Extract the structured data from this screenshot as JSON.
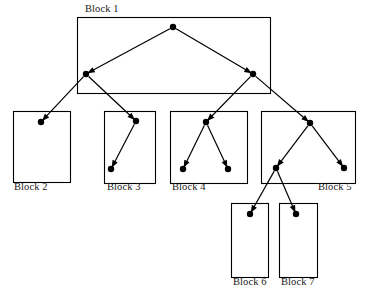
{
  "diagram": {
    "type": "tree-block-diagram",
    "background_color": "#ffffff",
    "stroke_color": "#000000",
    "node_color": "#000000",
    "canvas": {
      "width": 367,
      "height": 301
    },
    "blocks": [
      {
        "id": "block1",
        "label": "Block 1",
        "label_position": "above-left",
        "label_x": 85,
        "label_y": 3,
        "x": 77,
        "y": 17,
        "width": 193,
        "height": 76
      },
      {
        "id": "block2",
        "label": "Block 2",
        "label_position": "below-left",
        "label_x": 14,
        "label_y": 181,
        "x": 13,
        "y": 111,
        "width": 57,
        "height": 71
      },
      {
        "id": "block3",
        "label": "Block 3",
        "label_position": "below-left",
        "label_x": 107,
        "label_y": 181,
        "x": 104,
        "y": 111,
        "width": 51,
        "height": 72
      },
      {
        "id": "block4",
        "label": "Block 4",
        "label_position": "below-left",
        "label_x": 172,
        "label_y": 181,
        "x": 170,
        "y": 111,
        "width": 77,
        "height": 72
      },
      {
        "id": "block5",
        "label": "Block 5",
        "label_position": "below-right",
        "label_x": 318,
        "label_y": 181,
        "x": 261,
        "y": 111,
        "width": 94,
        "height": 72
      },
      {
        "id": "block6",
        "label": "Block 6",
        "label_position": "below-left",
        "label_x": 233,
        "label_y": 276,
        "x": 231,
        "y": 203,
        "width": 37,
        "height": 74
      },
      {
        "id": "block7",
        "label": "Block 7",
        "label_position": "below-left",
        "label_x": 281,
        "label_y": 276,
        "x": 279,
        "y": 203,
        "width": 38,
        "height": 74
      }
    ],
    "nodes": [
      {
        "id": "n-root",
        "x": 173,
        "y": 27,
        "block": "block1",
        "radius": 3.2
      },
      {
        "id": "n-l",
        "x": 86,
        "y": 74,
        "block": "block1",
        "radius": 3.2
      },
      {
        "id": "n-r",
        "x": 253,
        "y": 74,
        "block": "block1",
        "radius": 3.2
      },
      {
        "id": "n-b2",
        "x": 41,
        "y": 122,
        "block": "block2",
        "radius": 3.2
      },
      {
        "id": "n-b3a",
        "x": 136,
        "y": 121,
        "block": "block3",
        "radius": 3.2
      },
      {
        "id": "n-b3b",
        "x": 111,
        "y": 169,
        "block": "block3",
        "radius": 3.2
      },
      {
        "id": "n-b4a",
        "x": 206,
        "y": 122,
        "block": "block4",
        "radius": 3.2
      },
      {
        "id": "n-b4b",
        "x": 183,
        "y": 169,
        "block": "block4",
        "radius": 3.2
      },
      {
        "id": "n-b4c",
        "x": 228,
        "y": 169,
        "block": "block4",
        "radius": 3.2
      },
      {
        "id": "n-b5a",
        "x": 310,
        "y": 123,
        "block": "block5",
        "radius": 3.2
      },
      {
        "id": "n-b5b",
        "x": 276,
        "y": 168,
        "block": "block5",
        "radius": 3.2
      },
      {
        "id": "n-b5c",
        "x": 344,
        "y": 168,
        "block": "block5",
        "radius": 3.2
      },
      {
        "id": "n-b6",
        "x": 250,
        "y": 214,
        "block": "block6",
        "radius": 3.2
      },
      {
        "id": "n-b7",
        "x": 296,
        "y": 214,
        "block": "block7",
        "radius": 3.2
      }
    ],
    "edges": [
      {
        "id": "e-root-l",
        "from": "n-root",
        "to": "n-l",
        "arrow": true
      },
      {
        "id": "e-root-r",
        "from": "n-root",
        "to": "n-r",
        "arrow": true
      },
      {
        "id": "e-l-b2",
        "from": "n-l",
        "to": "n-b2",
        "arrow": true
      },
      {
        "id": "e-l-b3a",
        "from": "n-l",
        "to": "n-b3a",
        "arrow": true
      },
      {
        "id": "e-b3a-b3b",
        "from": "n-b3a",
        "to": "n-b3b",
        "arrow": true
      },
      {
        "id": "e-r-b4a",
        "from": "n-r",
        "to": "n-b4a",
        "arrow": true
      },
      {
        "id": "e-r-b5a",
        "from": "n-r",
        "to": "n-b5a",
        "arrow": true
      },
      {
        "id": "e-b4a-b4b",
        "from": "n-b4a",
        "to": "n-b4b",
        "arrow": true
      },
      {
        "id": "e-b4a-b4c",
        "from": "n-b4a",
        "to": "n-b4c",
        "arrow": true
      },
      {
        "id": "e-b5a-b5b",
        "from": "n-b5a",
        "to": "n-b5b",
        "arrow": true
      },
      {
        "id": "e-b5a-b5c",
        "from": "n-b5a",
        "to": "n-b5c",
        "arrow": true
      },
      {
        "id": "e-b5b-b6",
        "from": "n-b5b",
        "to": "n-b6",
        "arrow": true
      },
      {
        "id": "e-b5b-b7",
        "from": "n-b5b",
        "to": "n-b7",
        "arrow": true
      }
    ]
  }
}
